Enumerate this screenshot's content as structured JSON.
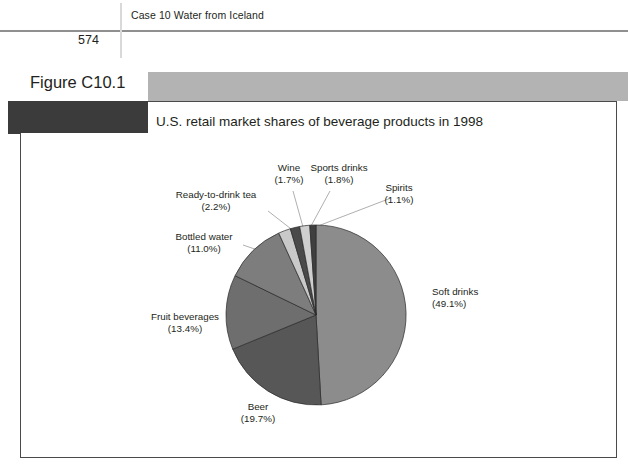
{
  "page": {
    "running_head": "Case 10 Water from Iceland",
    "page_number": "574",
    "figure_label": "Figure C10.1"
  },
  "chart_data": {
    "type": "pie",
    "title": "U.S. retail market shares of beverage products in 1998",
    "xlabel": "",
    "ylabel": "",
    "legend_position": "none",
    "grid": false,
    "units": "percent",
    "start_angle_deg": -90,
    "direction": "clockwise",
    "categories": [
      "Soft drinks",
      "Beer",
      "Fruit beverages",
      "Bottled water",
      "Ready-to-drink tea",
      "Wine",
      "Sports drinks",
      "Spirits"
    ],
    "values": [
      49.1,
      19.7,
      13.4,
      11.0,
      2.2,
      1.7,
      1.8,
      1.1
    ],
    "slices": [
      {
        "name": "Soft drinks",
        "value": 49.1,
        "label": "Soft drinks",
        "value_label": "(49.1%)",
        "color": "#8c8c8c",
        "label_x": 432,
        "label_y": 295,
        "anchor": "start",
        "leader": false
      },
      {
        "name": "Beer",
        "value": 19.7,
        "label": "Beer",
        "value_label": "(19.7%)",
        "color": "#575757",
        "label_x": 258,
        "label_y": 410,
        "anchor": "middle",
        "leader": false
      },
      {
        "name": "Fruit beverages",
        "value": 13.4,
        "label": "Fruit beverages",
        "value_label": "(13.4%)",
        "color": "#6e6e6e",
        "label_x": 185,
        "label_y": 320,
        "anchor": "middle",
        "leader": false
      },
      {
        "name": "Bottled water",
        "value": 11.0,
        "label": "Bottled water",
        "value_label": "(11.0%)",
        "color": "#7d7d7d",
        "label_x": 204,
        "label_y": 240,
        "anchor": "middle",
        "leader": true,
        "leader_from_x": 243,
        "leader_from_y": 245,
        "leader_to_x": 278,
        "leader_to_y": 257
      },
      {
        "name": "Ready-to-drink tea",
        "value": 2.2,
        "label": "Ready-to-drink tea",
        "value_label": "(2.2%)",
        "color": "#c9c9c9",
        "label_x": 216,
        "label_y": 198,
        "anchor": "middle",
        "leader": true,
        "leader_from_x": 268,
        "leader_from_y": 211,
        "leader_to_x": 295,
        "leader_to_y": 232
      },
      {
        "name": "Wine",
        "value": 1.7,
        "label": "Wine",
        "value_label": "(1.7%)",
        "color": "#4a4a4a",
        "label_x": 289,
        "label_y": 171,
        "anchor": "middle",
        "leader": true,
        "leader_from_x": 293,
        "leader_from_y": 191,
        "leader_to_x": 303,
        "leader_to_y": 227
      },
      {
        "name": "Sports drinks",
        "value": 1.8,
        "label": "Sports drinks",
        "value_label": "(1.8%)",
        "color": "#cfcfcf",
        "label_x": 339,
        "label_y": 171,
        "anchor": "middle",
        "leader": true,
        "leader_from_x": 330,
        "leader_from_y": 191,
        "leader_to_x": 311,
        "leader_to_y": 226
      },
      {
        "name": "Spirits",
        "value": 1.1,
        "label": "Spirits",
        "value_label": "(1.1%)",
        "color": "#3f3f3f",
        "label_x": 399,
        "label_y": 191,
        "anchor": "middle",
        "leader": true,
        "leader_from_x": 391,
        "leader_from_y": 198,
        "leader_to_x": 318,
        "leader_to_y": 226
      }
    ],
    "geometry": {
      "cx": 316,
      "cy": 315,
      "r": 90
    }
  }
}
